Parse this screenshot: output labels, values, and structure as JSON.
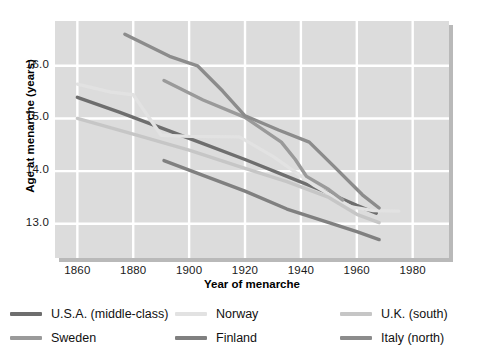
{
  "chart_data": {
    "type": "line",
    "title": "",
    "xlabel": "Year of menarche",
    "ylabel": "Age at menarche (years)",
    "xlim": [
      1852,
      1993
    ],
    "ylim": [
      12.35,
      16.85
    ],
    "xticks": [
      1860,
      1880,
      1900,
      1920,
      1940,
      1960,
      1980
    ],
    "xticklabels": [
      "1860",
      "1880",
      "1900",
      "1920",
      "1940",
      "1960",
      "1980"
    ],
    "yticks": [
      13.0,
      14.0,
      15.0,
      16.0
    ],
    "yticklabels": [
      "13.0",
      "14.0",
      "15.0",
      "16.0"
    ],
    "grid": true,
    "grid_color": "#ffffff",
    "plot_background": "#dcdcdc",
    "legend_position": "below-axes",
    "series": [
      {
        "name": "U.S.A. (middle-class)",
        "color": "#6e6e6e",
        "x": [
          1860,
          1875,
          1890,
          1905,
          1920,
          1935,
          1950,
          1960,
          1967
        ],
        "values": [
          15.4,
          15.12,
          14.82,
          14.52,
          14.22,
          13.9,
          13.58,
          13.35,
          13.2
        ]
      },
      {
        "name": "Norway",
        "color": "#e2e2e2",
        "x": [
          1860,
          1872,
          1880,
          1890,
          1900,
          1918,
          1930,
          1945,
          1958,
          1966,
          1975
        ],
        "values": [
          15.65,
          15.5,
          15.45,
          14.68,
          14.66,
          14.65,
          14.28,
          13.72,
          13.32,
          13.25,
          13.24
        ]
      },
      {
        "name": "U.K. (south)",
        "color": "#c6c6c6",
        "x": [
          1860,
          1880,
          1900,
          1920,
          1935,
          1950,
          1960,
          1968
        ],
        "values": [
          15.0,
          14.7,
          14.4,
          14.05,
          13.8,
          13.5,
          13.18,
          13.02
        ]
      },
      {
        "name": "Sweden",
        "color": "#9a9a9a",
        "x": [
          1891,
          1905,
          1920,
          1933,
          1938,
          1942,
          1950,
          1955
        ],
        "values": [
          15.72,
          15.35,
          15.02,
          14.55,
          14.22,
          13.9,
          13.65,
          13.45
        ]
      },
      {
        "name": "Finland",
        "color": "#808080",
        "x": [
          1891,
          1905,
          1920,
          1935,
          1950,
          1960,
          1968
        ],
        "values": [
          14.2,
          13.92,
          13.62,
          13.28,
          13.02,
          12.85,
          12.7
        ]
      },
      {
        "name": "Italy (north)",
        "color": "#8c8c8c",
        "x": [
          1877,
          1893,
          1903,
          1912,
          1920,
          1932,
          1943,
          1952,
          1962,
          1968
        ],
        "values": [
          16.6,
          16.18,
          16.0,
          15.52,
          15.05,
          14.78,
          14.55,
          14.08,
          13.55,
          13.3
        ]
      }
    ]
  },
  "legend": {
    "items": [
      {
        "label": "U.S.A. (middle-class)",
        "color": "#6e6e6e"
      },
      {
        "label": "Norway",
        "color": "#e2e2e2"
      },
      {
        "label": "U.K. (south)",
        "color": "#c6c6c6"
      },
      {
        "label": "Sweden",
        "color": "#9a9a9a"
      },
      {
        "label": "Finland",
        "color": "#808080"
      },
      {
        "label": "Italy (north)",
        "color": "#8c8c8c"
      }
    ]
  }
}
